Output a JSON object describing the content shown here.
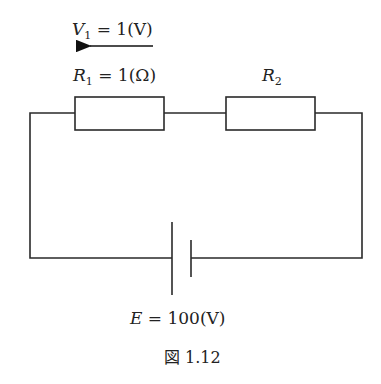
{
  "diagram": {
    "type": "circuit",
    "voltage_label": {
      "symbol": "V",
      "subscript": "1",
      "rest": " = 1(V)"
    },
    "r1_label": {
      "symbol": "R",
      "subscript": "1",
      "rest": " = 1(Ω)"
    },
    "r2_label": {
      "symbol": "R",
      "subscript": "2"
    },
    "source_label": {
      "symbol": "E",
      "rest": " = 100(V)"
    },
    "caption": "図 1.12",
    "components": [
      {
        "id": "R1",
        "type": "resistor",
        "value": "1 Ω"
      },
      {
        "id": "R2",
        "type": "resistor",
        "value": ""
      },
      {
        "id": "E",
        "type": "battery",
        "value": "100 V"
      }
    ],
    "arrow_direction": "left"
  }
}
